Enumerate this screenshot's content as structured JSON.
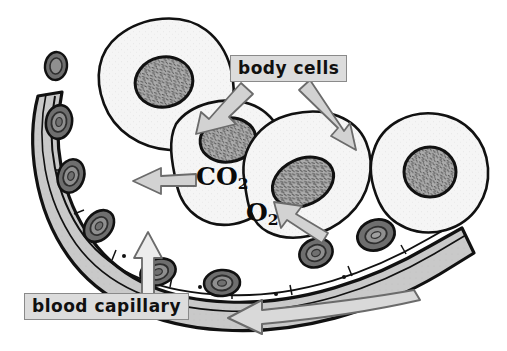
{
  "figure": {
    "background_color": "#ffffff",
    "labels": {
      "body_cells": "body cells",
      "blood_capillary": "blood capillary",
      "carbon_dioxide": "CO",
      "carbon_dioxide_subscript": "2",
      "oxygen": "O",
      "oxygen_subscript": "2"
    },
    "colors": {
      "outline": "#111111",
      "cell_fill": "#f4f4f4",
      "nucleus_fill": "#a8a8a8",
      "plasma_fill": "#c9c9c9",
      "vessel_wall": "#e6e6e6",
      "red_blood_cell_outer": "#6e6e6e",
      "red_blood_cell_inner": "#8f8f8f",
      "arrow_fill": "#d2d2d2",
      "arrow_stroke": "#6b6b6b",
      "label_box_fill": "#dcdcdc",
      "label_box_border": "#8a8a8a",
      "text": "#101010"
    },
    "body_cells_count": 4,
    "red_blood_cells_count": 8,
    "arrows": [
      {
        "name": "body-cells-left-pointer",
        "from": "body cells label",
        "to": "body cell 2 nucleus",
        "direction": "down-left"
      },
      {
        "name": "body-cells-right-pointer",
        "from": "body cells label",
        "to": "body cell 3",
        "direction": "down-right"
      },
      {
        "name": "co2-diffusion-arrow",
        "from": "body cell",
        "to": "blood capillary",
        "direction": "left"
      },
      {
        "name": "o2-diffusion-arrow",
        "from": "red blood cell",
        "to": "body cell 3",
        "direction": "up-left"
      },
      {
        "name": "blood-capillary-pointer",
        "from": "blood capillary label",
        "to": "capillary vessel",
        "direction": "up"
      },
      {
        "name": "blood-flow-arrow",
        "from": "right of capillary",
        "to": "left",
        "direction": "left"
      }
    ]
  }
}
